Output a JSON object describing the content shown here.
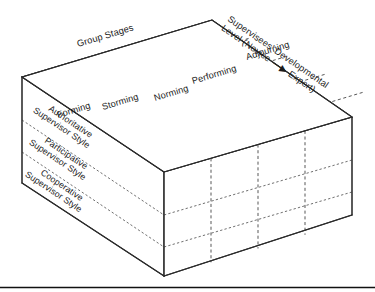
{
  "figure": {
    "title_top_left": "Group Stages",
    "axis_right_line1": "Supervisees' Developmental",
    "axis_right_line2_a": "Level (Novice",
    "axis_right_arrow": "—▶",
    "axis_right_line2_b": "Expert)",
    "group_stages": [
      {
        "label": "Forming"
      },
      {
        "label": "Storming"
      },
      {
        "label": "Norming"
      },
      {
        "label": "Performing"
      },
      {
        "label": "Adjourning"
      }
    ],
    "supervisor_styles": [
      {
        "line1": "Authoritative",
        "line2": "Supervisor Style"
      },
      {
        "line1": "Participative",
        "line2": "Supervisor Style"
      },
      {
        "line1": "Cooperative",
        "line2": "Supervisor Style"
      }
    ],
    "colors": {
      "stroke": "#2b2b2b",
      "dash": "#3a3a3a",
      "face": "#ffffff",
      "rule": "#111111",
      "text": "#1b1b1b"
    }
  }
}
